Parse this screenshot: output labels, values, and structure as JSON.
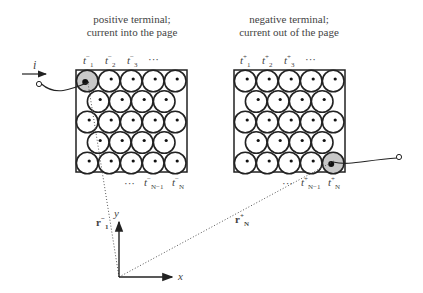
{
  "left_terminal": {
    "title_line1": "positive terminal;",
    "title_line2": "current into the page",
    "top_labels": [
      "t",
      "t",
      "t",
      "···"
    ],
    "top_subs": [
      "1",
      "2",
      "3"
    ],
    "top_sup": "−",
    "bottom_labels": [
      "···",
      "t",
      "t"
    ],
    "bottom_subs": [
      "N−1",
      "N"
    ],
    "rows": [
      5,
      4,
      5,
      4,
      5
    ]
  },
  "right_terminal": {
    "title_line1": "negative terminal;",
    "title_line2": "current out of the page",
    "top_labels": [
      "t",
      "t",
      "t",
      "···"
    ],
    "top_subs": [
      "1",
      "2",
      "3"
    ],
    "top_sup": "+",
    "bottom_labels": [
      "···",
      "t",
      "t"
    ],
    "bottom_subs": [
      "N−1",
      "N"
    ],
    "rows": [
      5,
      4,
      5,
      4,
      5
    ]
  },
  "current_label": "i",
  "vectors": {
    "r1": {
      "base": "r",
      "sub": "1",
      "sup": "−"
    },
    "rN": {
      "base": "r",
      "sub": "N",
      "sup": "+"
    }
  },
  "axes": {
    "x": "x",
    "y": "y"
  },
  "colors": {
    "stroke": "#222222",
    "highlight": "#c8c8c8",
    "text": "#444444"
  }
}
